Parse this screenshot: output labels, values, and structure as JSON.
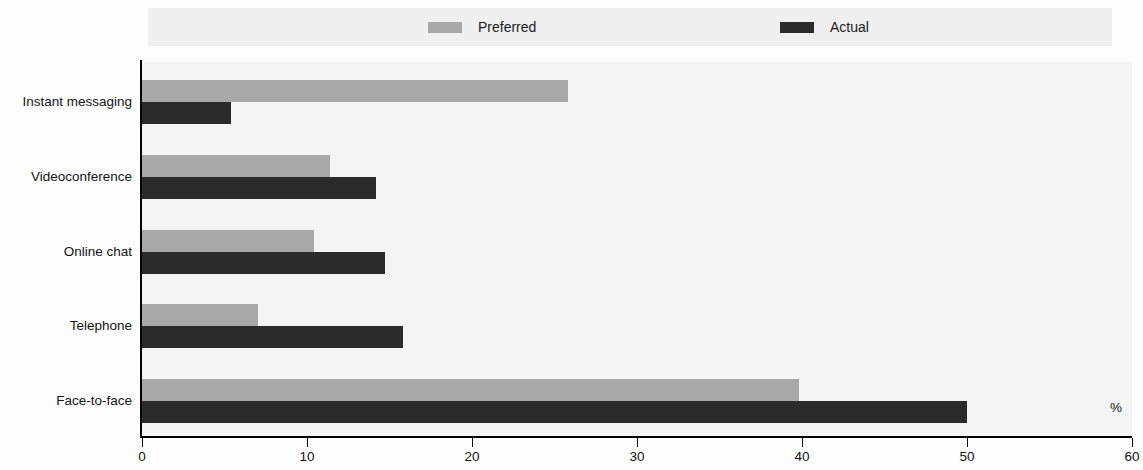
{
  "chart_data": {
    "type": "bar",
    "orientation": "horizontal",
    "title": "",
    "subtitle": "",
    "xlabel": "%",
    "ylabel": "",
    "xlim": [
      0,
      60
    ],
    "xticks": [
      0,
      10,
      20,
      30,
      40,
      50,
      60
    ],
    "xticklabels": [
      "0",
      "10",
      "20",
      "30",
      "40",
      "50",
      "60"
    ],
    "grid": false,
    "legend_position": "top",
    "categories": [
      "Instant messaging",
      "Videoconference",
      "Online chat",
      "Telephone",
      "Face-to-face"
    ],
    "series": [
      {
        "name": "Preferred",
        "color": "#a8a8a8",
        "values": [
          25.8,
          11.4,
          10.4,
          7.0,
          39.8
        ]
      },
      {
        "name": "Actual",
        "color": "#2b2b2b",
        "values": [
          5.4,
          14.2,
          14.7,
          15.8,
          50.0
        ]
      }
    ],
    "unit_annotation": "%"
  },
  "legend": {
    "entries": [
      {
        "label": "Preferred",
        "color": "#a8a8a8"
      },
      {
        "label": "Actual",
        "color": "#2b2b2b"
      }
    ],
    "background": "#f0f0f0"
  },
  "axes": {
    "x_tick_labels": [
      "0",
      "10",
      "20",
      "30",
      "40",
      "50",
      "60"
    ],
    "y_tick_labels": [
      "Instant messaging",
      "Videoconference",
      "Online chat",
      "Telephone",
      "Face-to-face"
    ],
    "unit_label": "%"
  },
  "colors": {
    "preferred": "#a8a8a8",
    "actual": "#2b2b2b",
    "plot_background": "#f4f4f4",
    "legend_background": "#f0f0f0",
    "axis": "#000000"
  }
}
